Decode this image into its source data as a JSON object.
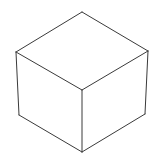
{
  "diagram": {
    "type": "isometric-cube-wireframe",
    "stroke_color": "#3a3a3a",
    "background": "#ffffff",
    "stroke_width": 1,
    "vertices": {
      "top": [
        82,
        12
      ],
      "left": [
        16,
        52
      ],
      "right": [
        148,
        51
      ],
      "front": [
        82,
        90
      ],
      "bottom_left": [
        19,
        115
      ],
      "bottom_right": [
        145,
        114
      ],
      "bottom": [
        82,
        152
      ]
    },
    "edges": [
      [
        "top",
        "left"
      ],
      [
        "top",
        "right"
      ],
      [
        "left",
        "front"
      ],
      [
        "right",
        "front"
      ],
      [
        "left",
        "bottom_left"
      ],
      [
        "right",
        "bottom_right"
      ],
      [
        "front",
        "bottom"
      ],
      [
        "bottom_left",
        "bottom"
      ],
      [
        "bottom_right",
        "bottom"
      ]
    ]
  }
}
